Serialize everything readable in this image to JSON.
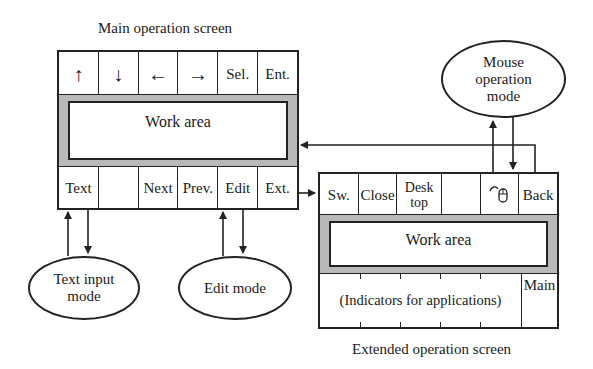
{
  "main_screen": {
    "title": "Main operation screen",
    "top_buttons": [
      {
        "label": "↑",
        "icon": "arrow-up-icon"
      },
      {
        "label": "↓",
        "icon": "arrow-down-icon"
      },
      {
        "label": "←",
        "icon": "arrow-left-icon"
      },
      {
        "label": "→",
        "icon": "arrow-right-icon"
      },
      {
        "label": "Sel."
      },
      {
        "label": "Ent."
      }
    ],
    "work_area_label": "Work area",
    "bottom_buttons": [
      {
        "label": "Text"
      },
      {
        "label": ""
      },
      {
        "label": "Next"
      },
      {
        "label": "Prev."
      },
      {
        "label": "Edit"
      },
      {
        "label": "Ext."
      }
    ]
  },
  "extended_screen": {
    "title": "Extended operation screen",
    "top_buttons": [
      {
        "label": "Sw."
      },
      {
        "label": "Close"
      },
      {
        "label": "Desk top"
      },
      {
        "label": ""
      },
      {
        "label": "",
        "icon": "mouse-icon"
      },
      {
        "label": "Back"
      }
    ],
    "work_area_label": "Work area",
    "indicators_label": "(Indicators for applications)",
    "main_button_label": "Main"
  },
  "modes": {
    "text_input": "Text input mode",
    "edit": "Edit mode",
    "mouse": "Mouse operation mode"
  }
}
